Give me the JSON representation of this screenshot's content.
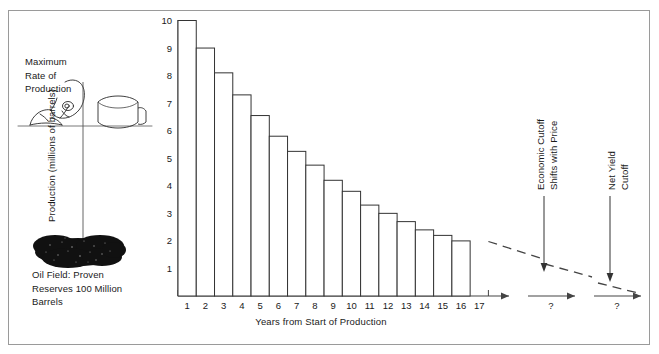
{
  "illustration": {
    "max_rate_label": "Maximum\nRate of\nProduction",
    "oil_field_label": "Oil Field:  Proven\nReserves 100 Million\nBarrels",
    "pumpjack_icon": "pumpjack-icon",
    "tank_icon": "storage-tank-icon",
    "oil_blob_icon": "oil-reservoir-blob-icon"
  },
  "annotations": {
    "economic_cutoff": "Economic Cutoff\nShifts with Price",
    "net_yield_cutoff": "Net Yield Cutoff",
    "unknown_year_1": "?",
    "unknown_year_2": "?"
  },
  "chart_data": {
    "type": "bar",
    "title": "",
    "xlabel": "Years from Start of Production",
    "ylabel": "Production (millions of barrels)",
    "categories": [
      "1",
      "2",
      "3",
      "4",
      "5",
      "6",
      "7",
      "8",
      "9",
      "10",
      "11",
      "12",
      "13",
      "14",
      "15",
      "16",
      "17"
    ],
    "values": [
      10,
      9,
      8.1,
      7.3,
      6.55,
      5.8,
      5.25,
      4.75,
      4.2,
      3.8,
      3.3,
      3.0,
      2.7,
      2.4,
      2.2,
      2.0,
      null
    ],
    "xtick_labels": [
      "1",
      "2",
      "3",
      "4",
      "5",
      "6",
      "7",
      "8",
      "9",
      "10",
      "11",
      "12",
      "13",
      "14",
      "15",
      "16",
      "17"
    ],
    "ytick_labels": [
      "1",
      "2",
      "3",
      "4",
      "5",
      "6",
      "7",
      "8",
      "9",
      "10"
    ],
    "ylim": [
      0,
      10
    ],
    "xlim": [
      0,
      17
    ],
    "grid": false,
    "legend": null,
    "extrapolation": {
      "style": "dashed",
      "note": "declining dashed trend continues past year 17 through two broken axis segments"
    },
    "colors": {
      "bar_fill": "#ffffff",
      "bar_stroke": "#333333",
      "axis": "#444444",
      "text": "#1a1a1a",
      "frame": "#9a9a9a"
    }
  }
}
